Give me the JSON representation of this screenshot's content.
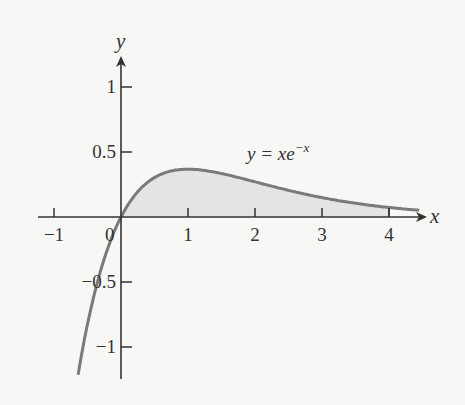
{
  "chart_data": {
    "type": "line",
    "title": "",
    "function": "y = x e^(-x)",
    "annotation": {
      "text_main": "y = xe",
      "text_sup": "−x",
      "x": 1.85,
      "y": 0.47
    },
    "xlabel": "x",
    "ylabel": "y",
    "xlim": [
      -1.2,
      4.4
    ],
    "ylim": [
      -1.25,
      1.2
    ],
    "x_ticks": [
      -1,
      1,
      2,
      3,
      4
    ],
    "x_tick_labels": [
      "−1",
      "1",
      "2",
      "3",
      "4"
    ],
    "origin_label": "0",
    "y_ticks": [
      1,
      0.5,
      -0.5,
      -1
    ],
    "y_tick_labels": [
      "1",
      "0.5",
      "−0.5",
      "−1"
    ],
    "curve_domain": [
      -0.64,
      4.45
    ],
    "shaded_region": {
      "from": 0,
      "to": 4,
      "description": "area under y = xe^(-x) between x=0 and x=4"
    },
    "x": [
      -0.6,
      -0.4,
      -0.2,
      0,
      0.5,
      1,
      1.5,
      2,
      2.5,
      3,
      3.5,
      4,
      4.4
    ],
    "values": [
      -1.093,
      -0.597,
      -0.244,
      0,
      0.303,
      0.368,
      0.335,
      0.271,
      0.205,
      0.149,
      0.106,
      0.073,
      0.054
    ],
    "grid": false,
    "legend": null
  },
  "colors": {
    "background": "#f7f7f6",
    "axis": "#333333",
    "curve": "#7a7a7a",
    "fill": "#e4e4e4"
  }
}
